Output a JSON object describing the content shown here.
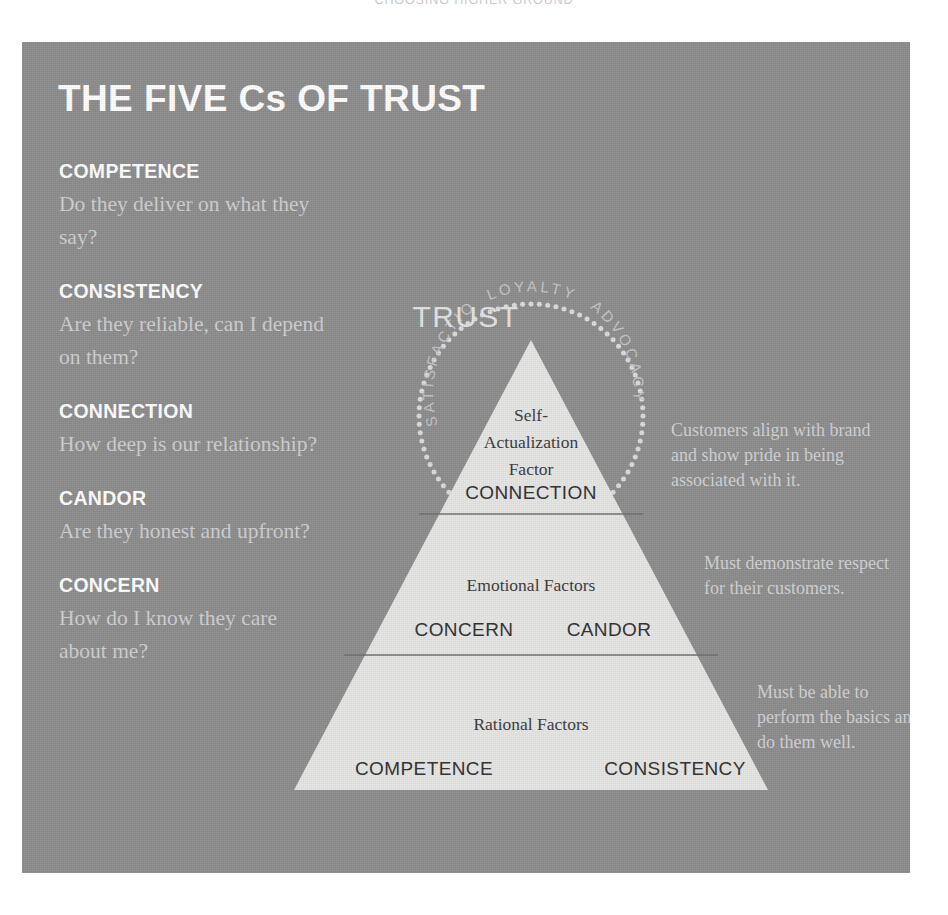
{
  "page_header": "CHOOSING HIGHER GROUND",
  "panel": {
    "title": "THE FIVE Cs OF TRUST",
    "background_color": "#8d8d8d"
  },
  "five_cs": [
    {
      "term": "COMPETENCE",
      "desc": "Do they deliver on what they say?"
    },
    {
      "term": "CONSISTENCY",
      "desc": "Are they reliable, can I depend on them?"
    },
    {
      "term": "CONNECTION",
      "desc": "How deep is our relationship?"
    },
    {
      "term": "CANDOR",
      "desc": "Are they honest and upfront?"
    },
    {
      "term": "CONCERN",
      "desc": "How do I know they care about me?"
    }
  ],
  "circle": {
    "center_label": "TRUST",
    "arc_words": [
      "SATISFACTION",
      "LOYALTY",
      "ADVOCACY"
    ]
  },
  "pyramid": {
    "tiers": [
      {
        "factor": "Self-Actualization Factor",
        "factor_lines": [
          "Self-",
          "Actualization",
          "Factor"
        ],
        "items": [
          "CONNECTION"
        ]
      },
      {
        "factor": "Emotional Factors",
        "factor_lines": [
          "Emotional Factors"
        ],
        "items": [
          "CONCERN",
          "CANDOR"
        ]
      },
      {
        "factor": "Rational Factors",
        "factor_lines": [
          "Rational Factors"
        ],
        "items": [
          "COMPETENCE",
          "CONSISTENCY"
        ]
      }
    ],
    "fill_color": "#e6e6e4"
  },
  "annotations": [
    "Customers align with brand and show pride in being associated with it.",
    "Must demonstrate respect for their customers.",
    "Must be able to perform the basics and do them well."
  ]
}
